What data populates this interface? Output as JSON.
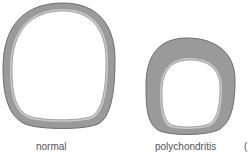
{
  "figure": {
    "colors": {
      "cartilage": "#9a9a9a",
      "inner_layer": "#c8c8c8",
      "outline": "#6e6e6e",
      "lumen": "#ffffff",
      "label": "#555555"
    },
    "panels": [
      {
        "id": "normal",
        "label": "normal",
        "description": "thin cartilage ring, large lumen"
      },
      {
        "id": "polychondritis",
        "label": "polychondritis",
        "description": "thickened cartilage ring, narrowed lumen"
      }
    ],
    "cropped_label": "("
  }
}
